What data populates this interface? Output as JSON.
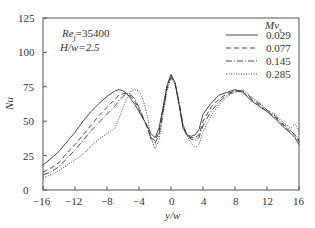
{
  "chart_data": {
    "type": "line",
    "title": "",
    "xlabel": "y/w",
    "ylabel": "Nu",
    "xlim": [
      -16,
      16
    ],
    "ylim": [
      0,
      125
    ],
    "xticks": [
      -16,
      -12,
      -8,
      -4,
      0,
      4,
      8,
      12,
      16
    ],
    "yticks": [
      0,
      25,
      50,
      75,
      100,
      125
    ],
    "grid": false,
    "legend_title": "Mv_s",
    "legend_position": "upper right",
    "annotations": [
      "Re_j=35400",
      "H/w=2.5"
    ],
    "series": [
      {
        "name": "0.029",
        "style": "solid",
        "x": [
          -16,
          -15,
          -14,
          -13,
          -12,
          -11,
          -10,
          -9,
          -8,
          -7,
          -6.5,
          -6,
          -5.5,
          -5,
          -4.5,
          -4,
          -3.5,
          -3,
          -2.5,
          -2,
          -1.5,
          -1,
          -0.5,
          0,
          0.5,
          1,
          1.5,
          2,
          2.5,
          3,
          3.5,
          4,
          5,
          6,
          7,
          8,
          9,
          10,
          11,
          12,
          13,
          14,
          15,
          15.5,
          16
        ],
        "y": [
          18,
          23,
          28,
          35,
          42,
          50,
          57,
          63,
          68,
          72,
          73,
          72,
          70,
          66,
          62,
          57,
          52,
          47,
          41,
          38,
          45,
          60,
          76,
          84,
          78,
          62,
          45,
          40,
          39,
          40,
          44,
          55,
          63,
          69,
          71,
          73,
          71,
          65,
          61,
          57,
          52,
          46,
          41,
          38,
          33
        ]
      },
      {
        "name": "0.077",
        "style": "dashed",
        "x": [
          -16,
          -15,
          -14,
          -13,
          -12,
          -11,
          -10,
          -9,
          -8,
          -7,
          -6.5,
          -6,
          -5.5,
          -5,
          -4.5,
          -4,
          -3.5,
          -3,
          -2.5,
          -2,
          -1.5,
          -1,
          -0.5,
          0,
          0.5,
          1,
          1.5,
          2,
          2.5,
          3,
          3.5,
          4,
          5,
          6,
          7,
          8,
          9,
          10,
          11,
          12,
          13,
          14,
          15,
          15.5,
          16
        ],
        "y": [
          13,
          16,
          20,
          27,
          33,
          40,
          47,
          54,
          60,
          66,
          69,
          70,
          70,
          68,
          64,
          59,
          52,
          46,
          38,
          36,
          42,
          58,
          75,
          83,
          78,
          63,
          46,
          40,
          38,
          38,
          40,
          50,
          60,
          66,
          70,
          72,
          71,
          66,
          62,
          57,
          53,
          47,
          42,
          40,
          35
        ]
      },
      {
        "name": "0.145",
        "style": "dashdot",
        "x": [
          -16,
          -15,
          -14,
          -13,
          -12,
          -11,
          -10,
          -9,
          -8,
          -7,
          -6.5,
          -6,
          -5.5,
          -5,
          -4.5,
          -4,
          -3.5,
          -3,
          -2.5,
          -2,
          -1.5,
          -1,
          -0.5,
          0,
          0.5,
          1,
          1.5,
          2,
          2.5,
          3,
          3.5,
          4,
          5,
          6,
          7,
          8,
          9,
          10,
          11,
          12,
          13,
          14,
          15,
          15.5,
          16
        ],
        "y": [
          11,
          13,
          17,
          23,
          29,
          36,
          43,
          49,
          55,
          61,
          65,
          68,
          70,
          69,
          66,
          60,
          53,
          46,
          37,
          34,
          40,
          57,
          74,
          82,
          78,
          64,
          47,
          40,
          37,
          36,
          38,
          47,
          57,
          64,
          69,
          72,
          72,
          67,
          63,
          58,
          54,
          48,
          43,
          40,
          36
        ]
      },
      {
        "name": "0.285",
        "style": "dotted",
        "x": [
          -16,
          -15,
          -14,
          -13,
          -12,
          -11,
          -10,
          -9,
          -8,
          -7,
          -6.5,
          -6,
          -5.5,
          -5,
          -4.5,
          -4,
          -3.5,
          -3,
          -2.5,
          -2,
          -1.5,
          -1,
          -0.5,
          0,
          0.5,
          1,
          1.5,
          2,
          2.5,
          3,
          3.5,
          4,
          5,
          6,
          7,
          8,
          9,
          10,
          11,
          12,
          13,
          14,
          15,
          15.5,
          16
        ],
        "y": [
          9,
          11,
          14,
          18,
          22,
          26,
          32,
          37,
          41,
          45,
          52,
          60,
          67,
          72,
          73,
          72,
          66,
          55,
          38,
          30,
          36,
          54,
          72,
          81,
          77,
          64,
          48,
          40,
          34,
          31,
          33,
          42,
          54,
          62,
          68,
          71,
          73,
          68,
          64,
          58,
          55,
          49,
          45,
          48,
          43
        ]
      }
    ]
  },
  "ui": {
    "yticks": [
      "0",
      "25",
      "50",
      "75",
      "100",
      "125"
    ],
    "xticks": [
      "−16",
      "−12",
      "−8",
      "−4",
      "0",
      "4",
      "8",
      "12",
      "16"
    ],
    "ylabel": "Nu",
    "xlabel": "y/w",
    "ann1_a": "Re",
    "ann1_sub": "j",
    "ann1_b": "=35400",
    "ann2": "H/w=2.5",
    "legend_title_a": "Mv",
    "legend_title_sub": "s",
    "legend": [
      "0.029",
      "0.077",
      "0.145",
      "0.285"
    ]
  }
}
